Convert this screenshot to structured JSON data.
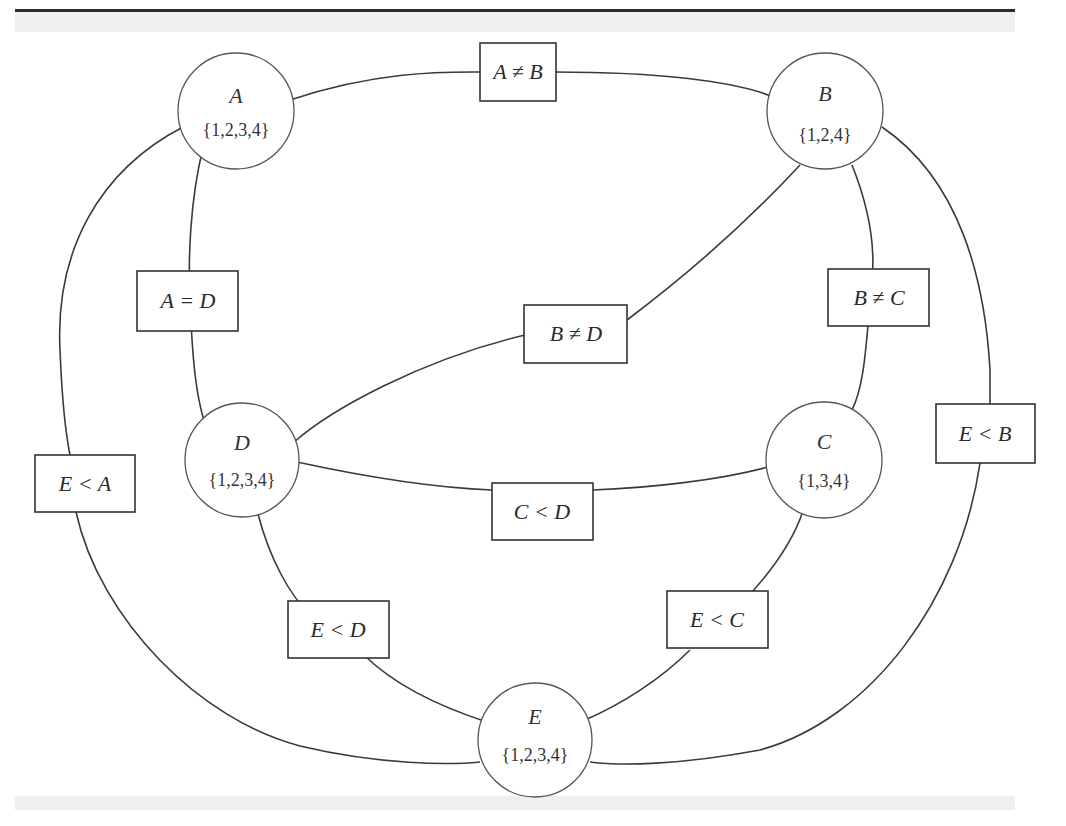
{
  "diagram": {
    "type": "constraint-graph",
    "nodes": [
      {
        "id": "A",
        "name": "A",
        "domain": "{1,2,3,4}"
      },
      {
        "id": "B",
        "name": "B",
        "domain": "{1,2,4}"
      },
      {
        "id": "C",
        "name": "C",
        "domain": "{1,3,4}"
      },
      {
        "id": "D",
        "name": "D",
        "domain": "{1,2,3,4}"
      },
      {
        "id": "E",
        "name": "E",
        "domain": "{1,2,3,4}"
      }
    ],
    "constraints": [
      {
        "from": "A",
        "to": "B",
        "label": "A ≠ B"
      },
      {
        "from": "A",
        "to": "D",
        "label": "A = D"
      },
      {
        "from": "B",
        "to": "D",
        "label": "B ≠ D"
      },
      {
        "from": "B",
        "to": "C",
        "label": "B ≠ C"
      },
      {
        "from": "E",
        "to": "A",
        "label": "E < A"
      },
      {
        "from": "E",
        "to": "B",
        "label": "E < B"
      },
      {
        "from": "C",
        "to": "D",
        "label": "C < D"
      },
      {
        "from": "E",
        "to": "D",
        "label": "E < D"
      },
      {
        "from": "E",
        "to": "C",
        "label": "E < C"
      }
    ]
  }
}
